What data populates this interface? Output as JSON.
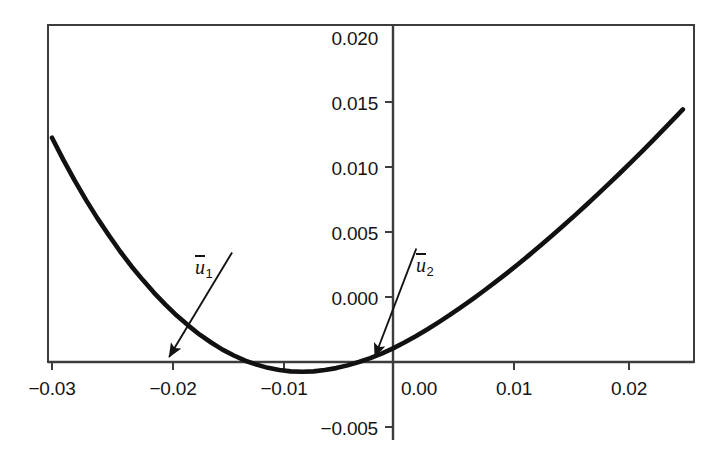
{
  "chart_data": {
    "type": "line",
    "title": "",
    "xlabel": "",
    "ylabel": "",
    "xlim": [
      -0.0325,
      0.0265
    ],
    "ylim": [
      -0.0057,
      0.0215
    ],
    "grid": false,
    "legend": null,
    "x_ticks": [
      {
        "value": -0.03,
        "label": "−0.03"
      },
      {
        "value": -0.02,
        "label": "−0.02"
      },
      {
        "value": -0.01,
        "label": "−0.01"
      },
      {
        "value": 0.0,
        "label": "0.00"
      },
      {
        "value": 0.01,
        "label": "0.01"
      },
      {
        "value": 0.02,
        "label": "0.02"
      }
    ],
    "y_ticks": [
      {
        "value": 0.02,
        "label": "0.020"
      },
      {
        "value": 0.015,
        "label": "0.015"
      },
      {
        "value": 0.01,
        "label": "0.010"
      },
      {
        "value": 0.005,
        "label": "0.005"
      },
      {
        "value": 0.0,
        "label": "0.000"
      },
      {
        "value": -0.005,
        "label": "−0.005"
      }
    ],
    "series": [
      {
        "name": "curve",
        "color": "#111111",
        "linewidth": 4,
        "x": [
          -0.03,
          -0.029,
          -0.028,
          -0.027,
          -0.026,
          -0.025,
          -0.024,
          -0.023,
          -0.022,
          -0.021,
          -0.02,
          -0.019,
          -0.018,
          -0.017,
          -0.016,
          -0.015,
          -0.014,
          -0.013,
          -0.012,
          -0.011,
          -0.01,
          -0.009,
          -0.008,
          -0.007,
          -0.006,
          -0.005,
          -0.004,
          -0.003,
          -0.002,
          -0.001,
          0.0,
          0.001,
          0.002,
          0.003,
          0.004,
          0.005,
          0.006,
          0.007,
          0.008,
          0.009,
          0.01,
          0.011,
          0.012,
          0.013,
          0.014,
          0.015,
          0.016,
          0.017,
          0.018,
          0.019,
          0.02,
          0.021,
          0.022,
          0.023,
          0.024,
          0.025,
          0.0255
        ],
        "y": [
          0.01725,
          0.01555,
          0.01395,
          0.01245,
          0.01105,
          0.00975,
          0.0085,
          0.00735,
          0.0063,
          0.0053,
          0.0044,
          0.00355,
          0.0028,
          0.0021,
          0.0015,
          0.00095,
          0.0005,
          0.0001,
          -0.0002,
          -0.00045,
          -0.00062,
          -0.00072,
          -0.00075,
          -0.00072,
          -0.00062,
          -0.00047,
          -0.00026,
          0.0,
          0.0003,
          0.00065,
          0.00105,
          0.0015,
          0.00198,
          0.0025,
          0.00305,
          0.00362,
          0.00422,
          0.00484,
          0.00548,
          0.00614,
          0.00682,
          0.00752,
          0.00824,
          0.00898,
          0.00973,
          0.0105,
          0.01128,
          0.01208,
          0.01289,
          0.01372,
          0.01456,
          0.01541,
          0.01628,
          0.01716,
          0.01806,
          0.01897,
          0.01943
        ]
      }
    ],
    "annotations": [
      {
        "id": "u1",
        "text_base": "u",
        "text_sub": "1",
        "label": "ū₁",
        "overline": true,
        "point_x": -0.0197,
        "point_y": 0.0,
        "text_x": -0.0138,
        "text_y": 0.0082
      },
      {
        "id": "u2",
        "text_base": "u",
        "text_sub": "2",
        "label": "ū₂",
        "overline": true,
        "point_x": -0.0016,
        "point_y": 0.0,
        "text_x": 0.0024,
        "text_y": 0.0085
      }
    ],
    "axes": {
      "frame": true,
      "frame_color": "#3c3c3c",
      "x_axis_line_y": 0.0,
      "y_axis_line_x": 0.0
    }
  },
  "ticks": {
    "y": [
      "0.020",
      "0.015",
      "0.010",
      "0.005",
      "0.000",
      "−0.005"
    ],
    "x": [
      "−0.03",
      "−0.02",
      "−0.01",
      "0.00",
      "0.01",
      "0.02"
    ]
  },
  "annotations": {
    "u1": {
      "base": "u",
      "sub": "1"
    },
    "u2": {
      "base": "u",
      "sub": "2"
    }
  }
}
